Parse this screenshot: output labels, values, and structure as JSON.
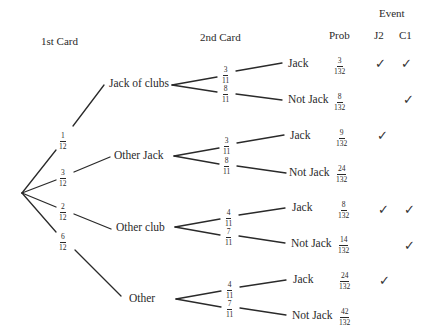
{
  "headers": {
    "first_card": "1st Card",
    "second_card": "2nd Card",
    "prob": "Prob",
    "event": "Event",
    "j2": "J2",
    "c1": "C1"
  },
  "first_level": [
    {
      "label": "Jack of clubs",
      "prob_num": "1",
      "prob_den": "12"
    },
    {
      "label": "Other Jack",
      "prob_num": "3",
      "prob_den": "12"
    },
    {
      "label": "Other club",
      "prob_num": "2",
      "prob_den": "12"
    },
    {
      "label": "Other",
      "prob_num": "6",
      "prob_den": "12"
    }
  ],
  "second_level": [
    {
      "label": "Jack",
      "branch_num": "3",
      "branch_den": "11",
      "prob_num": "3",
      "prob_den": "132",
      "j2": "✓",
      "c1": "✓"
    },
    {
      "label": "Not Jack",
      "branch_num": "8",
      "branch_den": "11",
      "prob_num": "8",
      "prob_den": "132",
      "j2": "",
      "c1": "✓"
    },
    {
      "label": "Jack",
      "branch_num": "3",
      "branch_den": "11",
      "prob_num": "9",
      "prob_den": "132",
      "j2": "✓",
      "c1": ""
    },
    {
      "label": "Not Jack",
      "branch_num": "8",
      "branch_den": "11",
      "prob_num": "24",
      "prob_den": "132",
      "j2": "",
      "c1": ""
    },
    {
      "label": "Jack",
      "branch_num": "4",
      "branch_den": "11",
      "prob_num": "8",
      "prob_den": "132",
      "j2": "✓",
      "c1": "✓"
    },
    {
      "label": "Not Jack",
      "branch_num": "7",
      "branch_den": "11",
      "prob_num": "14",
      "prob_den": "132",
      "j2": "",
      "c1": "✓"
    },
    {
      "label": "Jack",
      "branch_num": "4",
      "branch_den": "11",
      "prob_num": "24",
      "prob_den": "132",
      "j2": "✓",
      "c1": ""
    },
    {
      "label": "Not Jack",
      "branch_num": "7",
      "branch_den": "11",
      "prob_num": "42",
      "prob_den": "132",
      "j2": "",
      "c1": ""
    }
  ]
}
